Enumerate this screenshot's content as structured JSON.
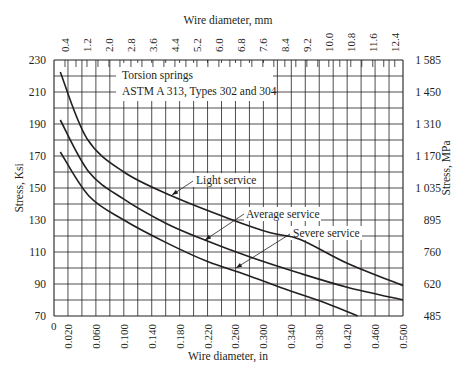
{
  "chart_data": {
    "type": "line",
    "title": "Torsion springs",
    "subtitle": "ASTM A 313, Types 302 and 304",
    "xlabel": "Wire diameter, in",
    "x2label": "Wire diameter, mm",
    "ylabel": "Stress, Ksi",
    "y2label": "Stress, MPa",
    "xlim": [
      0,
      0.5
    ],
    "ylim": [
      70,
      230
    ],
    "grid": true,
    "x_ticks": [
      "0",
      "0.020",
      "0.060",
      "0.100",
      "0.140",
      "0.180",
      "0.220",
      "0.260",
      "0.300",
      "0.340",
      "0.380",
      "0.420",
      "0.460",
      "0.500"
    ],
    "x2_ticks": [
      "0.4",
      "1.2",
      "2.0",
      "2.8",
      "3.6",
      "4.4",
      "5.2",
      "6.0",
      "6.8",
      "7.6",
      "8.4",
      "9.2",
      "10.0",
      "10.8",
      "11.6",
      "12.4"
    ],
    "y_ticks": [
      "70",
      "90",
      "110",
      "130",
      "150",
      "170",
      "190",
      "210",
      "230"
    ],
    "y2_ticks": [
      "485",
      "620",
      "760",
      "895",
      "1 035",
      "1 170",
      "1 310",
      "1 450",
      "1 585"
    ],
    "series": [
      {
        "name": "Light service",
        "x": [
          0.009,
          0.047,
          0.1,
          0.169,
          0.25,
          0.31,
          0.352,
          0.42,
          0.5
        ],
        "y": [
          222.5,
          181,
          160,
          145,
          131,
          122,
          118,
          103,
          89
        ]
      },
      {
        "name": "Average service",
        "x": [
          0.009,
          0.05,
          0.1,
          0.16,
          0.216,
          0.28,
          0.35,
          0.42,
          0.5
        ],
        "y": [
          192.5,
          160,
          143,
          128,
          117.5,
          107,
          97,
          88,
          80
        ]
      },
      {
        "name": "Severe service",
        "x": [
          0.009,
          0.05,
          0.1,
          0.16,
          0.22,
          0.274,
          0.33,
          0.39,
          0.435
        ],
        "y": [
          172.5,
          145,
          130,
          116,
          104,
          96,
          87,
          78,
          70
        ]
      }
    ]
  },
  "annotations": {
    "light": "Light service",
    "average": "Average service",
    "severe": "Severe service"
  }
}
